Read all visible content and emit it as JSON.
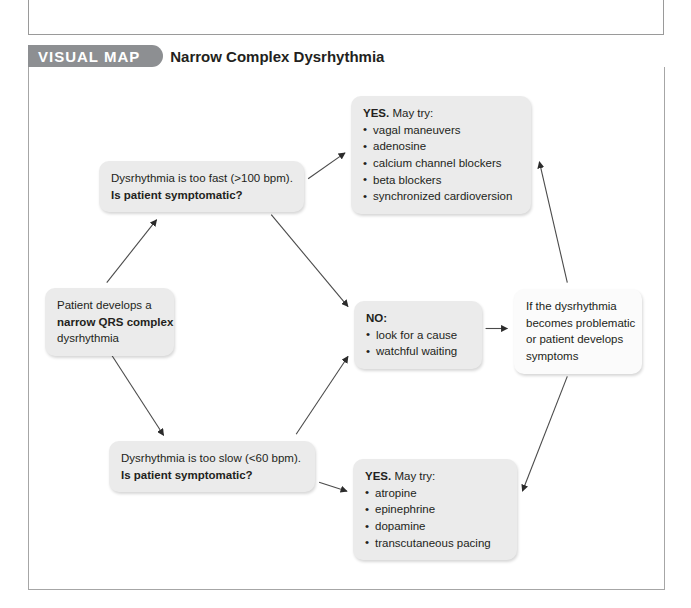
{
  "header": {
    "tab_label": "VISUAL MAP",
    "title": "Narrow Complex Dysrhythmia"
  },
  "nodes": {
    "start": {
      "line1": "Patient develops a",
      "line2_bold": "narrow QRS complex",
      "line3": "dysrhythmia"
    },
    "fast_question": {
      "line1": "Dysrhythmia is too fast (>100 bpm).",
      "line2_bold": "Is patient symptomatic?"
    },
    "slow_question": {
      "line1": "Dysrhythmia is too slow (<60 bpm).",
      "line2_bold": "Is patient symptomatic?"
    },
    "yes_fast": {
      "lead_bold": "YES.",
      "lead_rest": " May try:",
      "items": [
        "vagal maneuvers",
        "adenosine",
        "calcium channel blockers",
        "beta blockers",
        "synchronized cardioversion"
      ]
    },
    "no_center": {
      "lead_bold": "NO:",
      "items": [
        "look for a cause",
        "watchful waiting"
      ]
    },
    "yes_slow": {
      "lead_bold": "YES.",
      "lead_rest": " May try:",
      "items": [
        "atropine",
        "epinephrine",
        "dopamine",
        "transcutaneous pacing"
      ]
    },
    "recurrence": {
      "line1": "If the dysrhythmia",
      "line2": "becomes problematic",
      "line3": "or patient develops",
      "line4": "symptoms"
    }
  },
  "colors": {
    "tab_background": "#8d8f92",
    "node_gray": "#ebebeb",
    "node_white": "#fbfbfb",
    "frame_border": "#a6a6a6",
    "text": "#231f20",
    "connector": "#3a3a3a"
  }
}
